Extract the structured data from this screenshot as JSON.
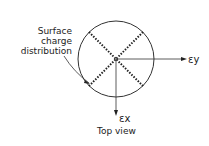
{
  "diagram": {
    "annotation": [
      "Surface",
      "charge",
      "distribution"
    ],
    "axis_y_label": "εy",
    "axis_x_label": "εx",
    "caption": "Top view"
  }
}
